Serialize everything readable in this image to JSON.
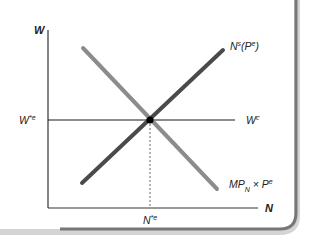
{
  "diagram": {
    "type": "labor-market-equilibrium",
    "axes": {
      "y_label": "W",
      "x_label": "N"
    },
    "curves": [
      {
        "id": "labor-supply",
        "label_main": "N",
        "label_sup": "s",
        "label_paren_open": "(P",
        "label_paren_sup": "e",
        "label_paren_close": ")",
        "color": "#4a4a4a"
      },
      {
        "id": "labor-demand",
        "label_main": "MP",
        "label_sub": "N",
        "label_times": " × P",
        "label_sup": "e",
        "color": "#8c8c8c"
      },
      {
        "id": "contract-wage",
        "label_main": "W",
        "label_sup": "c",
        "color": "#1a1a1a"
      }
    ],
    "equilibrium": {
      "wage_label": "W",
      "wage_sup": "*e",
      "employment_label": "N",
      "employment_sup": "*e"
    },
    "colors": {
      "frame_border": "#6e6e6e",
      "frame_shadow": "#c8c8c8",
      "axis": "#333333"
    }
  }
}
